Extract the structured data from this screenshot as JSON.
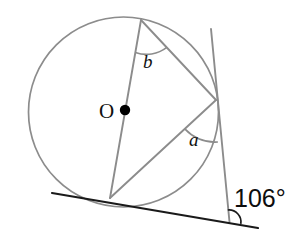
{
  "figure": {
    "type": "circle-geometry-diagram",
    "colors": {
      "circle_stroke": "#8c8c8c",
      "chord_stroke": "#8c8c8c",
      "tangent_stroke": "#1a1a1a",
      "arc_stroke": "#8c8c8c",
      "center_dot": "#000000",
      "text": "#111111",
      "background": "#ffffff"
    },
    "labels": {
      "center": "O",
      "angle_b": "b",
      "angle_a": "a",
      "angle_value": "106°"
    },
    "geometry": {
      "circle": {
        "cx": 123.5,
        "cy": 112,
        "r": 95
      },
      "center_dot": {
        "cx": 125,
        "cy": 110,
        "r": 5
      },
      "points": {
        "top_vertex": {
          "x": 141,
          "y": 20
        },
        "right_vertex": {
          "x": 216,
          "y": 100
        },
        "tangent_point": {
          "x": 110,
          "y": 198
        }
      },
      "tangent_line": {
        "x1": 52,
        "y1": 193,
        "x2": 258,
        "y2": 228
      },
      "transversal_line": {
        "x1": 211,
        "y1": 29,
        "x2": 229.5,
        "y2": 222
      },
      "angle_vertex_106": {
        "x": 229,
        "y": 222
      }
    }
  }
}
